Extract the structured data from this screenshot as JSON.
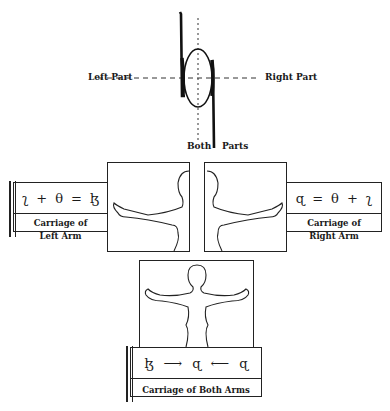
{
  "top_glyph": {
    "axis_labels": {
      "left": "Left Part",
      "right": "Right Part",
      "bottom_left": "Both",
      "bottom_right": "Parts"
    }
  },
  "panels": {
    "left_arm": {
      "equation": [
        "ʅ",
        "+",
        "θ",
        "=",
        "ɮ"
      ],
      "caption_line1": "Carriage of",
      "caption_line2": "Left Arm"
    },
    "right_arm": {
      "equation": [
        "ɋ",
        "=",
        "θ",
        "+",
        "ʅ"
      ],
      "caption_line1": "Carriage of",
      "caption_line2": "Right Arm"
    },
    "both_arms": {
      "equation": [
        "ɮ",
        "⟶",
        "ɋ",
        "⟵",
        "ɋ"
      ],
      "caption": "Carriage of Both Arms"
    }
  },
  "colors": {
    "ink": "#1a1a1a",
    "paper": "#ffffff"
  }
}
